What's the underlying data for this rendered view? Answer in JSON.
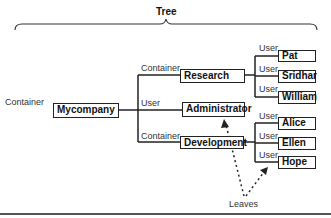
{
  "title": "Tree",
  "root": {
    "type_label": "Container",
    "name": "Mycompany"
  },
  "level1": [
    {
      "type_label": "Container",
      "name": "Research"
    },
    {
      "type_label": "User",
      "name": "Administrator"
    },
    {
      "type_label": "Container",
      "name": "Development"
    }
  ],
  "research_children": [
    {
      "type_label": "User",
      "name": "Pat"
    },
    {
      "type_label": "User",
      "name": "Sridhar"
    },
    {
      "type_label": "User",
      "name": "William"
    }
  ],
  "development_children": [
    {
      "type_label": "User",
      "name": "Alice"
    },
    {
      "type_label": "User",
      "name": "Ellen"
    },
    {
      "type_label": "User",
      "name": "Hope"
    }
  ],
  "annotation": "Leaves",
  "colors": {
    "line": "#222222",
    "text": "#333333"
  }
}
